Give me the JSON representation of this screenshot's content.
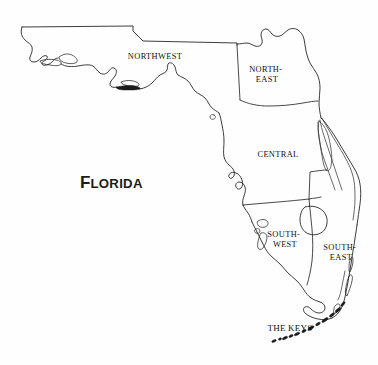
{
  "map": {
    "title": "FLORIDA",
    "title_initial": "F",
    "title_rest": "LORIDA",
    "background_color": "#fefefe",
    "stroke_color": "#1a1a1a",
    "regions": [
      {
        "id": "northwest",
        "label": "NORTHWEST",
        "lines": [
          "NORTHWEST"
        ],
        "label_x": 155,
        "label_y": 57
      },
      {
        "id": "northeast",
        "label": "NORTH-EAST",
        "lines": [
          "NORTH-",
          "EAST"
        ],
        "label_x": 267,
        "label_y": 70
      },
      {
        "id": "central",
        "label": "CENTRAL",
        "lines": [
          "CENTRAL"
        ],
        "label_x": 278,
        "label_y": 155
      },
      {
        "id": "southwest",
        "label": "SOUTH-WEST",
        "lines": [
          "SOUTH-",
          "WEST"
        ],
        "label_x": 285,
        "label_y": 235
      },
      {
        "id": "southeast",
        "label": "SOUTH-EAST",
        "lines": [
          "SOUTH-",
          "EAST"
        ],
        "label_x": 341,
        "label_y": 248
      },
      {
        "id": "the-keys",
        "label": "THE KEYS",
        "lines": [
          "THE KEYS"
        ],
        "label_x": 290,
        "label_y": 331
      }
    ]
  }
}
